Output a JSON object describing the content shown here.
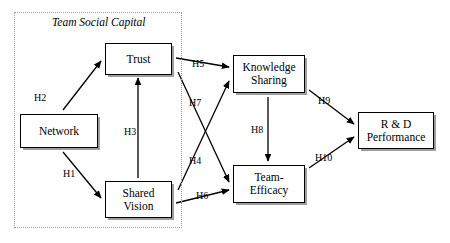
{
  "diagram": {
    "canvas": {
      "width": 450,
      "height": 243
    },
    "group": {
      "label": "Team Social Capital",
      "border_style": "dotted",
      "border_color": "#9a9a9a"
    },
    "nodes": [
      {
        "id": "network",
        "label": "Network"
      },
      {
        "id": "trust",
        "label": "Trust"
      },
      {
        "id": "shared_vision",
        "label": "Shared\nVision"
      },
      {
        "id": "knowledge",
        "label": "Knowledge\nSharing"
      },
      {
        "id": "efficacy",
        "label": "Team-\nEfficacy"
      },
      {
        "id": "rd",
        "label": "R & D\nPerformance"
      }
    ],
    "edges": [
      {
        "id": "H1",
        "label": "H1",
        "from": "network",
        "to": "shared_vision"
      },
      {
        "id": "H2",
        "label": "H2",
        "from": "network",
        "to": "trust"
      },
      {
        "id": "H3",
        "label": "H3",
        "from": "shared_vision",
        "to": "trust"
      },
      {
        "id": "H4",
        "label": "H4",
        "from": "shared_vision",
        "to": "knowledge"
      },
      {
        "id": "H5",
        "label": "H5",
        "from": "trust",
        "to": "knowledge"
      },
      {
        "id": "H6",
        "label": "H6",
        "from": "shared_vision",
        "to": "efficacy"
      },
      {
        "id": "H7",
        "label": "H7",
        "from": "trust",
        "to": "efficacy"
      },
      {
        "id": "H8",
        "label": "H8",
        "from": "knowledge",
        "to": "efficacy"
      },
      {
        "id": "H9",
        "label": "H9",
        "from": "knowledge",
        "to": "rd"
      },
      {
        "id": "H10",
        "label": "H10",
        "from": "efficacy",
        "to": "rd"
      }
    ],
    "colors": {
      "line": "#000000",
      "box_border": "#000000",
      "background": "#ffffff",
      "group_border": "#9a9a9a"
    }
  }
}
